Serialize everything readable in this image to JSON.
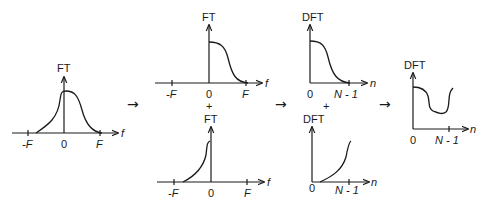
{
  "diagram": {
    "panels": [
      {
        "id": "ft-full",
        "y_label": "FT",
        "x_label": "f",
        "ticks": [
          "-F",
          "0",
          "F"
        ]
      },
      {
        "id": "ft-positive",
        "y_label": "FT",
        "x_label": "f",
        "ticks": [
          "-F",
          "0",
          "F"
        ]
      },
      {
        "id": "ft-negative",
        "y_label": "FT",
        "x_label": "f",
        "ticks": [
          "-F",
          "0",
          "F"
        ]
      },
      {
        "id": "dft-positive",
        "y_label": "DFT",
        "x_label": "n",
        "ticks": [
          "0",
          "N - 1"
        ]
      },
      {
        "id": "dft-negative",
        "y_label": "DFT",
        "x_label": "n",
        "ticks": [
          "0",
          "N - 1"
        ]
      },
      {
        "id": "dft-combined",
        "y_label": "DFT",
        "x_label": "n",
        "ticks": [
          "0",
          "N - 1"
        ]
      }
    ],
    "operators": {
      "plus": "+",
      "arrow": "→"
    }
  }
}
